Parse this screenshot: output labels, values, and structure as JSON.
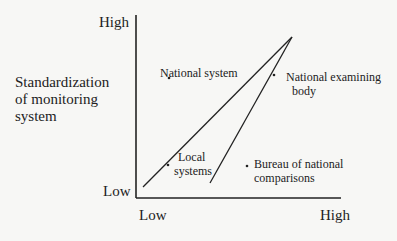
{
  "diagram": {
    "y_axis": {
      "label_lines": [
        "Standardization",
        "of monitoring",
        "system"
      ],
      "high": "High",
      "low": "Low"
    },
    "x_axis": {
      "low": "Low",
      "high": "High"
    },
    "points": [
      {
        "label": "National system",
        "x": 169,
        "y": 78
      },
      {
        "label_lines": [
          "National examining",
          "body"
        ],
        "x": 274,
        "y": 75
      },
      {
        "label_lines": [
          "Local",
          "systems"
        ],
        "x": 168,
        "y": 165
      },
      {
        "label_lines": [
          "Bureau of national",
          "comparisons"
        ],
        "x": 247,
        "y": 166
      }
    ],
    "lines": [
      {
        "from": [
          143,
          187
        ],
        "to": [
          292,
          37
        ]
      },
      {
        "from": [
          210,
          183
        ],
        "to": [
          292,
          37
        ]
      }
    ],
    "colors": {
      "ink": "#222222",
      "background": "#f7f7f5"
    }
  }
}
